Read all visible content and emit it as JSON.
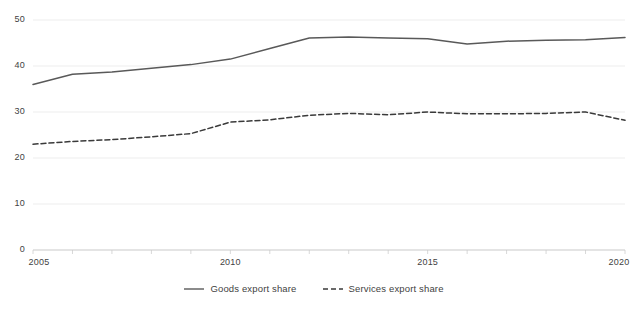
{
  "chart_data": {
    "type": "line",
    "title": "",
    "subtitle": "",
    "xlabel": "",
    "ylabel": "",
    "xlim": [
      2005,
      2020
    ],
    "ylim": [
      0,
      50
    ],
    "grid": true,
    "legend_position": "bottom",
    "x": [
      2005,
      2006,
      2007,
      2008,
      2009,
      2010,
      2011,
      2012,
      2013,
      2014,
      2015,
      2016,
      2017,
      2018,
      2019,
      2020
    ],
    "x_ticks": [
      "2005",
      "2010",
      "2015",
      "2020"
    ],
    "x_tick_values": [
      2005,
      2010,
      2015,
      2020
    ],
    "y_ticks": [
      "0",
      "10",
      "20",
      "30",
      "40",
      "50"
    ],
    "y_tick_values": [
      0,
      10,
      20,
      30,
      40,
      50
    ],
    "series": [
      {
        "name": "Goods export share",
        "style": "solid",
        "color": "#595959",
        "values": [
          36.0,
          38.2,
          38.7,
          39.5,
          40.3,
          41.5,
          43.8,
          46.1,
          46.3,
          46.1,
          45.9,
          44.8,
          45.4,
          45.6,
          45.7,
          46.2
        ]
      },
      {
        "name": "Services export share",
        "style": "dashed",
        "color": "#3a3a3a",
        "values": [
          23.0,
          23.6,
          24.0,
          24.6,
          25.3,
          27.8,
          28.3,
          29.3,
          29.7,
          29.4,
          30.0,
          29.6,
          29.6,
          29.7,
          30.0,
          28.2
        ]
      }
    ],
    "colors": {
      "axis": "#bfbfbf",
      "grid": "#ededed",
      "text": "#3f3f3f",
      "background": "#ffffff"
    }
  }
}
